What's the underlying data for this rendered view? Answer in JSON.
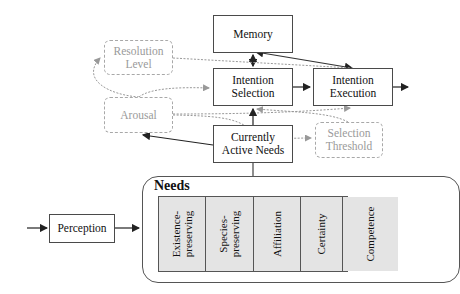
{
  "diagram": {
    "boxes": {
      "memory": "Memory",
      "intention_selection": "Intention\nSelection",
      "intention_execution": "Intention\nExecution",
      "resolution_level": "Resolution\nLevel",
      "arousal": "Arousal",
      "currently_active_needs": "Currently\nActive Needs",
      "selection_threshold": "Selection\nThreshold",
      "perception": "Perception"
    },
    "needs": {
      "title": "Needs",
      "items": [
        "Existence-\npreserving",
        "Species-\npreserving",
        "Affiliation",
        "Certainty",
        "Competence"
      ]
    },
    "colors": {
      "solid_stroke": "#333333",
      "modulator_stroke": "#a0a0a0",
      "need_fill": "#e4e4e4"
    }
  }
}
